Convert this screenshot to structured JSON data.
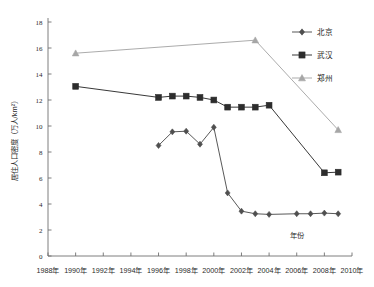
{
  "chart_data": {
    "type": "line",
    "title": "",
    "xlabel": "年份",
    "ylabel": "居住人口密度（万人/km²）",
    "xlim": [
      1988,
      2010
    ],
    "ylim": [
      0,
      18
    ],
    "ytick_step": 2,
    "xtick_step": 2,
    "grid": false,
    "legend_position": "top-right",
    "xticks": [
      "1988年",
      "1990年",
      "1992年",
      "1994年",
      "1996年",
      "1998年",
      "2000年",
      "2002年",
      "2004年",
      "2006年",
      "2008年",
      "2010年"
    ],
    "yticks": [
      "0",
      "2",
      "4",
      "6",
      "8",
      "10",
      "12",
      "14",
      "16",
      "18"
    ],
    "series": [
      {
        "name": "北京",
        "color": "#4f4f4f",
        "marker": "diamond",
        "x": [
          1996,
          1997,
          1998,
          1999,
          2000,
          2001,
          2002,
          2003,
          2004,
          2006,
          2007,
          2008,
          2009
        ],
        "values": [
          8.5,
          9.55,
          9.6,
          8.6,
          9.9,
          4.85,
          3.45,
          3.25,
          3.2,
          3.25,
          3.25,
          3.3,
          3.25
        ]
      },
      {
        "name": "武汉",
        "color": "#2d2d2d",
        "marker": "square",
        "x": [
          1990,
          1996,
          1997,
          1998,
          1999,
          2000,
          2001,
          2002,
          2003,
          2004,
          2008,
          2009
        ],
        "values": [
          13.05,
          12.2,
          12.3,
          12.3,
          12.2,
          12.0,
          11.45,
          11.45,
          11.45,
          11.6,
          6.4,
          6.45
        ]
      },
      {
        "name": "郑州",
        "color": "#a6a6a6",
        "marker": "triangle",
        "x": [
          1990,
          2003,
          2009
        ],
        "values": [
          15.6,
          16.6,
          9.7
        ]
      }
    ]
  },
  "legend": {
    "items": [
      {
        "label": "北京"
      },
      {
        "label": "武汉"
      },
      {
        "label": "郑州"
      }
    ]
  }
}
